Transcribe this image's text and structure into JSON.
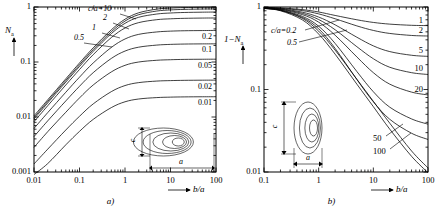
{
  "figure": {
    "panels": [
      {
        "id": "a",
        "caption": "a)",
        "ylabel": "N",
        "ylabel_sub": "a",
        "xlabel": "b/a",
        "inset_shape": "prolate-ellipsoid",
        "inset_c": "c",
        "inset_a": "a",
        "xticks": [
          "0.01",
          "0.1",
          "1",
          "10",
          "100"
        ],
        "yticks": [
          "1",
          "0.1",
          "0.01",
          "0.001"
        ],
        "series_head_label": "c/a=10",
        "head_labels": [
          "2",
          "1",
          "0.5"
        ],
        "right_labels": [
          "0.2",
          "0.1",
          "0.05",
          "0.02",
          "0.01"
        ]
      },
      {
        "id": "b",
        "caption": "b)",
        "ylabel": "1−N",
        "ylabel_sub": "a",
        "xlabel": "b/a",
        "inset_shape": "oblate-ellipsoid",
        "inset_c": "c",
        "inset_a": "a",
        "xticks": [
          "0.1",
          "1",
          "10",
          "100"
        ],
        "yticks": [
          "1",
          "0.1",
          "0.01"
        ],
        "series_head_label": "c/a=0.2",
        "head_labels": [
          "0.5"
        ],
        "right_labels": [
          "1",
          "2",
          "5",
          "10",
          "20"
        ],
        "lead_labels": [
          "50",
          "100"
        ]
      }
    ]
  },
  "chart_data": [
    {
      "type": "line",
      "title": "",
      "xlabel": "b/a",
      "ylabel": "N_a",
      "xscale": "log",
      "yscale": "log",
      "xlim": [
        0.01,
        100
      ],
      "ylim": [
        0.001,
        1
      ],
      "grid": false,
      "legend": "inline-curve-labels",
      "x": [
        0.01,
        0.02,
        0.05,
        0.1,
        0.2,
        0.5,
        1,
        2,
        5,
        10,
        20,
        50,
        100
      ],
      "series": [
        {
          "name": "c/a=10",
          "label_pos": "head",
          "values": [
            0.0105,
            0.0205,
            0.0495,
            0.096,
            0.181,
            0.385,
            0.6,
            0.785,
            0.915,
            0.955,
            0.975,
            0.988,
            0.993
          ]
        },
        {
          "name": "2",
          "label_pos": "head",
          "values": [
            0.0098,
            0.0192,
            0.0462,
            0.089,
            0.168,
            0.355,
            0.555,
            0.725,
            0.845,
            0.885,
            0.905,
            0.918,
            0.923
          ]
        },
        {
          "name": "1",
          "label_pos": "head",
          "values": [
            0.0092,
            0.018,
            0.0432,
            0.083,
            0.156,
            0.328,
            0.505,
            0.65,
            0.745,
            0.778,
            0.795,
            0.805,
            0.81
          ]
        },
        {
          "name": "0.5",
          "label_pos": "head",
          "values": [
            0.0082,
            0.016,
            0.0382,
            0.073,
            0.136,
            0.278,
            0.415,
            0.52,
            0.588,
            0.61,
            0.622,
            0.629,
            0.632
          ]
        },
        {
          "name": "0.2",
          "label_pos": "right",
          "values": [
            0.0062,
            0.012,
            0.0282,
            0.053,
            0.096,
            0.184,
            0.262,
            0.318,
            0.352,
            0.364,
            0.37,
            0.373,
            0.375
          ]
        },
        {
          "name": "0.1",
          "label_pos": "right",
          "values": [
            0.0044,
            0.0085,
            0.0196,
            0.0362,
            0.064,
            0.116,
            0.158,
            0.186,
            0.203,
            0.209,
            0.212,
            0.2135,
            0.214
          ]
        },
        {
          "name": "0.05",
          "label_pos": "right",
          "values": [
            0.0028,
            0.0054,
            0.0122,
            0.0222,
            0.0382,
            0.066,
            0.087,
            0.1,
            0.1075,
            0.11,
            0.1115,
            0.1122,
            0.1125
          ]
        },
        {
          "name": "0.02",
          "label_pos": "right",
          "values": [
            0.0014,
            0.0026,
            0.0058,
            0.0103,
            0.0173,
            0.0289,
            0.0373,
            0.0422,
            0.045,
            0.0459,
            0.0464,
            0.0467,
            0.0468
          ]
        },
        {
          "name": "0.01",
          "label_pos": "right",
          "values": [
            0.00076,
            0.00142,
            0.00312,
            0.00548,
            0.00905,
            0.01482,
            0.0189,
            0.02125,
            0.02255,
            0.02298,
            0.0232,
            0.02332,
            0.02336
          ]
        }
      ]
    },
    {
      "type": "line",
      "title": "",
      "xlabel": "b/a",
      "ylabel": "1-N_a",
      "xscale": "log",
      "yscale": "log",
      "xlim": [
        0.1,
        100
      ],
      "ylim": [
        0.01,
        1
      ],
      "grid": false,
      "legend": "inline-curve-labels",
      "x": [
        0.1,
        0.2,
        0.5,
        1,
        2,
        5,
        10,
        20,
        50,
        100
      ],
      "series": [
        {
          "name": "c/a=0.2",
          "label_pos": "head",
          "values": [
            0.96,
            0.9,
            0.7,
            0.47,
            0.268,
            0.116,
            0.062,
            0.033,
            0.0155,
            0.0098
          ]
        },
        {
          "name": "0.5",
          "label_pos": "head",
          "values": [
            0.965,
            0.912,
            0.73,
            0.51,
            0.3,
            0.133,
            0.072,
            0.039,
            0.018,
            0.0112
          ]
        },
        {
          "name": "1",
          "label_pos": "right",
          "values": [
            0.99,
            0.975,
            0.93,
            0.87,
            0.79,
            0.7,
            0.65,
            0.62,
            0.6,
            0.595
          ]
        },
        {
          "name": "2",
          "label_pos": "right",
          "values": [
            0.985,
            0.965,
            0.905,
            0.825,
            0.72,
            0.59,
            0.52,
            0.478,
            0.452,
            0.445
          ]
        },
        {
          "name": "5",
          "label_pos": "right",
          "values": [
            0.98,
            0.952,
            0.866,
            0.755,
            0.608,
            0.43,
            0.338,
            0.288,
            0.26,
            0.252
          ]
        },
        {
          "name": "10",
          "label_pos": "right",
          "values": [
            0.975,
            0.942,
            0.838,
            0.705,
            0.53,
            0.33,
            0.236,
            0.186,
            0.16,
            0.152
          ]
        },
        {
          "name": "20",
          "label_pos": "right",
          "values": [
            0.972,
            0.933,
            0.81,
            0.655,
            0.455,
            0.248,
            0.16,
            0.116,
            0.093,
            0.086
          ]
        },
        {
          "name": "50",
          "label_pos": "lead",
          "values": [
            0.966,
            0.92,
            0.772,
            0.585,
            0.362,
            0.165,
            0.094,
            0.061,
            0.044,
            0.038
          ]
        },
        {
          "name": "100",
          "label_pos": "lead",
          "values": [
            0.963,
            0.912,
            0.748,
            0.545,
            0.315,
            0.132,
            0.071,
            0.0435,
            0.0295,
            0.0248
          ]
        }
      ]
    }
  ]
}
